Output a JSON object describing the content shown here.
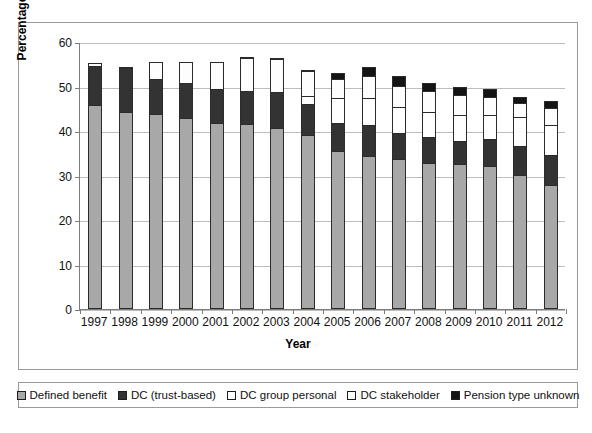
{
  "chart_data": {
    "type": "bar",
    "subtype": "stacked-bar",
    "title": "",
    "xlabel": "Year",
    "ylabel": "Percentage of employees",
    "ylim": [
      0,
      60
    ],
    "ytick_values": [
      60,
      50,
      40,
      30,
      20,
      10,
      0
    ],
    "yticks": [
      "60",
      "50",
      "40",
      "30",
      "20",
      "10",
      "0"
    ],
    "grid": true,
    "legend_position": "bottom",
    "categories": [
      "1997",
      "1998",
      "1999",
      "2000",
      "2001",
      "2002",
      "2003",
      "2004",
      "2005",
      "2006",
      "2007",
      "2008",
      "2009",
      "2010",
      "2011",
      "2012"
    ],
    "series": [
      {
        "name": "Defined benefit",
        "color": "#a8a8a8",
        "values": [
          45.8,
          44.3,
          43.9,
          43.0,
          41.9,
          41.5,
          40.6,
          39.1,
          35.4,
          34.4,
          33.6,
          32.9,
          32.6,
          32.1,
          30.2,
          27.9
        ]
      },
      {
        "name": "DC (trust-based)",
        "color": "#333333",
        "values": [
          8.8,
          9.8,
          7.8,
          7.9,
          7.6,
          7.6,
          8.2,
          6.9,
          6.4,
          7.0,
          6.0,
          5.7,
          5.2,
          6.0,
          6.4,
          6.8
        ]
      },
      {
        "name": "DC group personal",
        "color": "#ffffff",
        "values": [
          0.0,
          0.0,
          0.0,
          0.0,
          0.0,
          0.0,
          0.0,
          1.8,
          5.6,
          6.0,
          5.8,
          5.7,
          5.7,
          5.6,
          6.5,
          6.7
        ]
      },
      {
        "name": "DC stakeholder",
        "color": "#ffffff",
        "values": [
          0.7,
          0.3,
          3.8,
          4.6,
          6.0,
          7.2,
          7.4,
          5.8,
          4.4,
          4.9,
          4.8,
          4.6,
          4.6,
          4.0,
          3.3,
          3.8
        ]
      },
      {
        "name": "Pension type unknown",
        "color": "#141414",
        "values": [
          0.0,
          0.0,
          0.0,
          0.0,
          0.0,
          0.3,
          0.3,
          0.2,
          1.3,
          2.1,
          2.2,
          1.9,
          1.8,
          1.7,
          1.3,
          1.6
        ]
      }
    ],
    "totals": [
      55.3,
      54.4,
      55.5,
      55.5,
      55.5,
      56.6,
      56.5,
      53.8,
      53.1,
      54.4,
      52.4,
      50.8,
      49.9,
      49.4,
      47.7,
      46.8
    ]
  },
  "axis": {
    "x_title": "Year",
    "y_title": "Percentage of employees"
  },
  "legend": {
    "items": [
      {
        "label": "Defined benefit",
        "swatch": "defined-benefit-swatch"
      },
      {
        "label": "DC (trust-based)",
        "swatch": "dc-trust-based-swatch"
      },
      {
        "label": "DC group personal",
        "swatch": "dc-group-personal-swatch"
      },
      {
        "label": "DC stakeholder",
        "swatch": "dc-stakeholder-swatch"
      },
      {
        "label": "Pension type unknown",
        "swatch": "pension-type-unknown-swatch"
      }
    ]
  }
}
